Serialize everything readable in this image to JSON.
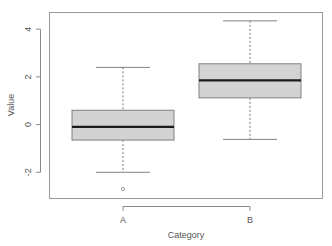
{
  "chart_data": {
    "type": "boxplot",
    "title": "",
    "xlabel": "Category",
    "ylabel": "Value",
    "categories": [
      "A",
      "B"
    ],
    "ylim": [
      -3.1,
      4.7
    ],
    "yticks": [
      -2,
      0,
      2,
      4
    ],
    "ytick_labels": [
      "-2",
      "0",
      "2",
      "4"
    ],
    "grid": false,
    "legend": null,
    "series": [
      {
        "name": "A",
        "whisker_low": -2.0,
        "q1": -0.65,
        "median": -0.1,
        "q3": 0.6,
        "whisker_high": 2.4,
        "outliers": [
          -2.7
        ]
      },
      {
        "name": "B",
        "whisker_low": -0.62,
        "q1": 1.12,
        "median": 1.85,
        "q3": 2.55,
        "whisker_high": 4.35,
        "outliers": []
      }
    ],
    "colors": {
      "box_fill": "#d3d3d3",
      "box_stroke": "#808080",
      "median": "#1a1a1a"
    }
  }
}
